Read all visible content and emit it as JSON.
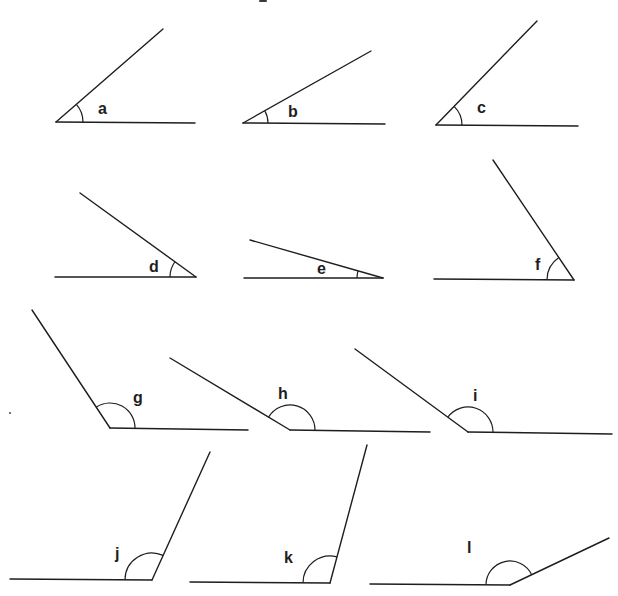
{
  "diagram": {
    "title": "",
    "type": "angle-identification-exercise",
    "stroke_color": "#1e1e1e",
    "background_color": "#ffffff",
    "angles": [
      {
        "label": "a",
        "vertex": [
          56,
          122
        ],
        "ray_end": [
          163,
          29
        ],
        "base_end": [
          195,
          123
        ],
        "arc_radius": 27,
        "label_pos": [
          98,
          114
        ],
        "kind": "acute"
      },
      {
        "label": "b",
        "vertex": [
          243,
          123
        ],
        "ray_end": [
          371,
          51
        ],
        "base_end": [
          385,
          124
        ],
        "arc_radius": 25,
        "label_pos": [
          288,
          117
        ],
        "kind": "acute"
      },
      {
        "label": "c",
        "vertex": [
          436,
          125
        ],
        "ray_end": [
          537,
          21
        ],
        "base_end": [
          578,
          126
        ],
        "arc_radius": 26,
        "label_pos": [
          477,
          113
        ],
        "kind": "acute"
      },
      {
        "label": "d",
        "vertex": [
          196,
          277
        ],
        "ray_end": [
          80,
          193
        ],
        "base_end": [
          55,
          277
        ],
        "arc_radius": 26,
        "label_pos": [
          149,
          272
        ],
        "kind": "acute"
      },
      {
        "label": "e",
        "vertex": [
          383,
          278
        ],
        "ray_end": [
          250,
          240
        ],
        "base_end": [
          244,
          278
        ],
        "arc_radius": 26,
        "label_pos": [
          317,
          274
        ],
        "kind": "acute"
      },
      {
        "label": "f",
        "vertex": [
          574,
          280
        ],
        "ray_end": [
          493,
          160
        ],
        "base_end": [
          434,
          279
        ],
        "arc_radius": 27,
        "label_pos": [
          535,
          270
        ],
        "kind": "acute"
      },
      {
        "label": "g",
        "vertex": [
          110,
          428
        ],
        "ray_end": [
          32,
          310
        ],
        "base_end": [
          248,
          430
        ],
        "arc_radius": 25,
        "label_pos": [
          133,
          403
        ],
        "kind": "obtuse"
      },
      {
        "label": "h",
        "vertex": [
          290,
          430
        ],
        "ray_end": [
          170,
          358
        ],
        "base_end": [
          430,
          432
        ],
        "arc_radius": 25,
        "label_pos": [
          278,
          399
        ],
        "kind": "obtuse"
      },
      {
        "label": "i",
        "vertex": [
          468,
          432
        ],
        "ray_end": [
          355,
          349
        ],
        "base_end": [
          612,
          434
        ],
        "arc_radius": 25,
        "label_pos": [
          473,
          401
        ],
        "kind": "obtuse"
      },
      {
        "label": "j",
        "vertex": [
          152,
          580
        ],
        "ray_end": [
          210,
          452
        ],
        "base_end": [
          10,
          579
        ],
        "arc_radius": 27,
        "label_pos": [
          115,
          559
        ],
        "kind": "obtuse"
      },
      {
        "label": "k",
        "vertex": [
          330,
          583
        ],
        "ray_end": [
          367,
          445
        ],
        "base_end": [
          190,
          582
        ],
        "arc_radius": 27,
        "label_pos": [
          284,
          563
        ],
        "kind": "obtuse"
      },
      {
        "label": "l",
        "vertex": [
          510,
          585
        ],
        "ray_end": [
          609,
          538
        ],
        "base_end": [
          370,
          584
        ],
        "arc_radius": 24,
        "label_pos": [
          467,
          553
        ],
        "kind": "obtuse"
      }
    ]
  }
}
